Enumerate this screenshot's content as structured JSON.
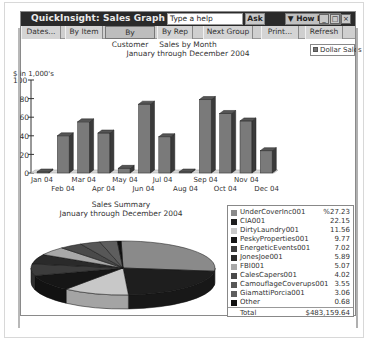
{
  "window": {
    "title": "QuickInsight: Sales Graph",
    "help_placeholder": "Type a help question",
    "ask_label": "Ask",
    "how_do_i_label": "▼ How Do I?",
    "controls": {
      "minimize": "_",
      "maximize": "□",
      "close": "×"
    }
  },
  "toolbar": {
    "buttons": [
      {
        "label": "Dates...",
        "pressed": false
      },
      {
        "label": "By Item",
        "pressed": false
      },
      {
        "label": "By Customer",
        "pressed": true
      },
      {
        "label": "By Rep",
        "pressed": false
      },
      {
        "label": "Next Group",
        "pressed": false
      },
      {
        "label": "Print...",
        "pressed": false
      },
      {
        "label": "Refresh",
        "pressed": false
      }
    ]
  },
  "colors": {
    "titlebar": "#2a2a2a",
    "bar_front": "#7a7a7a",
    "bar_side": "#3a3a3a",
    "bar_top": "#555555"
  },
  "chart_data": [
    {
      "type": "bar",
      "title": "Sales by Month",
      "subtitle": "January through December 2004",
      "ylabel": "$ in 1,000's",
      "xlabel": "",
      "ylim": [
        0,
        100
      ],
      "yticks": [
        "100",
        "80",
        "60",
        "40",
        "20",
        "0"
      ],
      "legend": [
        "Dollar Sales"
      ],
      "legend_position": "top-right",
      "grid": false,
      "categories": [
        "Jan 04",
        "Feb 04",
        "Mar 04",
        "Apr 04",
        "May 04",
        "Jun 04",
        "Jul 04",
        "Aug 04",
        "Sep 04",
        "Oct 04",
        "Nov 04",
        "Dec 04"
      ],
      "series": [
        {
          "name": "Dollar Sales",
          "values": [
            1,
            40,
            55,
            43,
            5,
            74,
            39,
            0,
            79,
            64,
            56,
            24
          ]
        }
      ]
    },
    {
      "type": "pie",
      "title": "Sales Summary",
      "subtitle": "January through December 2004",
      "legend_position": "right",
      "categories": [
        "UnderCoverInc001",
        "CIA001",
        "DirtyLaundry001",
        "PeskyProperties001",
        "EnergeticEvents001",
        "JonesJoe001",
        "FBI001",
        "CalesCapers001",
        "CamouflageCoverups001",
        "GiamattiPorcia001",
        "Other"
      ],
      "values": [
        27.23,
        22.15,
        11.56,
        9.77,
        7.02,
        5.89,
        5.07,
        4.02,
        3.55,
        3.06,
        0.68
      ],
      "value_labels": [
        "%27.23",
        "22.15",
        "11.56",
        "9.77",
        "7.02",
        "5.89",
        "5.07",
        "4.02",
        "3.55",
        "3.06",
        "0.68"
      ],
      "colors": [
        "#8a8a8a",
        "#1e1e1e",
        "#c8c8c8",
        "#161616",
        "#3c3c3c",
        "#2a2a2a",
        "#a8a8a8",
        "#4a4a4a",
        "#575757",
        "#5e5e5e",
        "#101010"
      ],
      "total_label": "Total",
      "total_value": "$483,159.64"
    }
  ]
}
